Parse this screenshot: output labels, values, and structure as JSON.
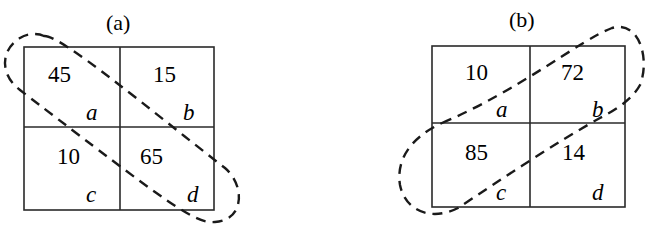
{
  "panels": [
    {
      "title": "(a)",
      "cells": [
        {
          "value": "45",
          "label": "a"
        },
        {
          "value": "15",
          "label": "b"
        },
        {
          "value": "10",
          "label": "c"
        },
        {
          "value": "65",
          "label": "d"
        }
      ],
      "loop_encircles": "a-d diagonal"
    },
    {
      "title": "(b)",
      "cells": [
        {
          "value": "10",
          "label": "a"
        },
        {
          "value": "72",
          "label": "b"
        },
        {
          "value": "85",
          "label": "c"
        },
        {
          "value": "14",
          "label": "d"
        }
      ],
      "loop_encircles": "c-b diagonal"
    }
  ]
}
